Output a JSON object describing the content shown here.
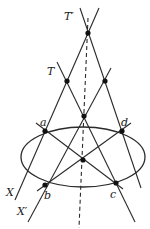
{
  "diagram": {
    "stroke_color": "#2a2a2a",
    "point_color": "#111111",
    "ellipse": {
      "cx": 83,
      "cy": 157,
      "rx": 62,
      "ry": 30
    },
    "points": {
      "T_prime": {
        "label": "T′",
        "x": 88,
        "y": 33
      },
      "T": {
        "label": "T",
        "x": 67,
        "y": 81
      },
      "R": {
        "label": "",
        "x": 105,
        "y": 81
      },
      "M": {
        "label": "",
        "x": 84,
        "y": 116
      },
      "a": {
        "label": "a",
        "x": 45,
        "y": 131
      },
      "d": {
        "label": "d",
        "x": 122,
        "y": 131
      },
      "O": {
        "label": "",
        "x": 83,
        "y": 160
      },
      "b": {
        "label": "b",
        "x": 45,
        "y": 185
      },
      "c": {
        "label": "c",
        "x": 116,
        "y": 183
      }
    },
    "lines": [
      {
        "name": "line-X",
        "x1": 99,
        "y1": 8,
        "x2": 15,
        "y2": 200,
        "label": "X"
      },
      {
        "name": "line-through-d",
        "x1": 80,
        "y1": 8,
        "x2": 141,
        "y2": 188
      },
      {
        "name": "line-T-c",
        "x1": 57,
        "y1": 62,
        "x2": 135,
        "y2": 222
      },
      {
        "name": "line-X-prime",
        "x1": 111,
        "y1": 68,
        "x2": 28,
        "y2": 222,
        "label": "X′"
      },
      {
        "name": "diagonal-a-c",
        "x1": 36,
        "y1": 123,
        "x2": 123,
        "y2": 189
      },
      {
        "name": "diagonal-d-b",
        "x1": 131,
        "y1": 123,
        "x2": 37,
        "y2": 191
      }
    ],
    "dashed_axis": {
      "x1": 88,
      "y1": 18,
      "x2": 79,
      "y2": 228
    },
    "labels": {
      "T_prime": "T′",
      "T": "T",
      "a": "a",
      "d": "d",
      "b": "b",
      "c": "c",
      "X": "X",
      "X_prime": "X′"
    }
  }
}
